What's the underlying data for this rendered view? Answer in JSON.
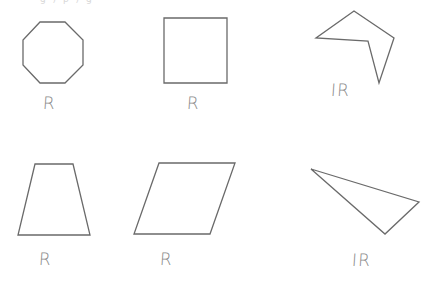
{
  "figure": {
    "top_fragment": "g ) p ) g",
    "stroke_color": "#6a6a6a",
    "label_color": "#8a8a8a",
    "shapes": [
      {
        "id": "octagon",
        "type": "regular octagon",
        "label": "R",
        "points": "40,22 65,22 83,40 83,65 65,83 40,83 23,65 23,40",
        "label_pos": {
          "x": 43,
          "y": 95
        }
      },
      {
        "id": "square",
        "type": "square",
        "label": "R",
        "points": "164,18 227,18 227,83 164,83",
        "label_pos": {
          "x": 187,
          "y": 95
        }
      },
      {
        "id": "irregular-pentagon",
        "type": "irregular concave pentagon",
        "label": "IR",
        "points": "354,11 394,38 379,83 368,41 316,38",
        "label_pos": {
          "x": 331,
          "y": 82
        }
      },
      {
        "id": "trapezoid",
        "type": "trapezoid",
        "label": "R",
        "points": "35,164 73,164 90,235 18,235",
        "label_pos": {
          "x": 39,
          "y": 251
        }
      },
      {
        "id": "parallelogram",
        "type": "parallelogram",
        "label": "R",
        "points": "159,163 235,163 210,234 134,234",
        "label_pos": {
          "x": 160,
          "y": 251
        }
      },
      {
        "id": "scalene-triangle",
        "type": "scalene triangle",
        "label": "IR",
        "points": "311,169 419,202 385,234",
        "label_pos": {
          "x": 352,
          "y": 252
        }
      }
    ]
  }
}
